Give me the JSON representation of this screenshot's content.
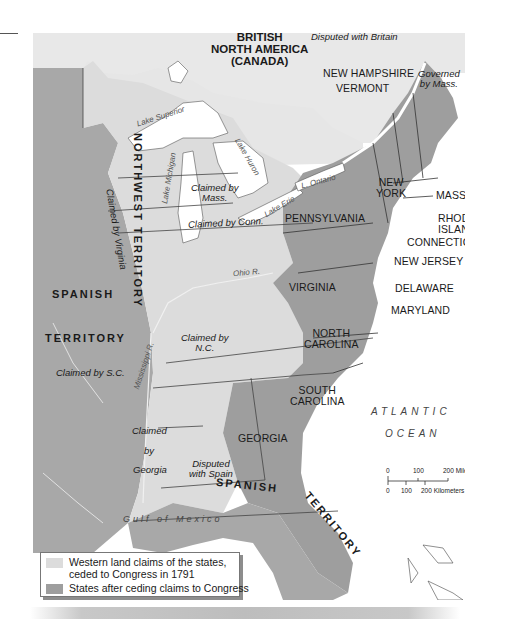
{
  "map": {
    "title_rule": true,
    "colors": {
      "states_fill": "#9e9e9e",
      "western_claims_fill": "#dcdcdc",
      "spanish_territory_fill": "#a8a8a8",
      "canada_fill": "#e6e6e6",
      "water": "#ffffff",
      "border": "#3a3a3a",
      "river": "#f2f2f2"
    },
    "regions": {
      "british_north_america": [
        "BRITISH",
        "NORTH AMERICA",
        "(CANADA)"
      ],
      "disputed_with_britain": "Disputed with Britain",
      "st_lawrence": "St. Lawrence R.",
      "new_hampshire": "NEW HAMPSHIRE",
      "vermont": "VERMONT",
      "governed_by_mass": [
        "Governed",
        "by Mass."
      ],
      "new_york": [
        "NEW",
        "YORK"
      ],
      "mass": "MASS.",
      "rhode_island": [
        "RHODE",
        "ISLAND"
      ],
      "connecticut": "CONNECTICUT",
      "pennsylvania": "PENNSYLVANIA",
      "new_jersey": "NEW JERSEY",
      "delaware": "DELAWARE",
      "maryland": "MARYLAND",
      "virginia": "VIRGINIA",
      "north_carolina": [
        "NORTH",
        "CAROLINA"
      ],
      "south_carolina": [
        "SOUTH",
        "CAROLINA"
      ],
      "georgia": "GEORGIA",
      "northwest_territory": "NORTHWEST TERRITORY",
      "claimed_by_mass": [
        "Claimed by",
        "Mass."
      ],
      "claimed_by_conn": "Claimed by Conn.",
      "claimed_by_virginia": [
        "Claimed",
        "by",
        "Virginia"
      ],
      "claimed_by_nc": [
        "Claimed by",
        "N.C."
      ],
      "claimed_by_sc": "Claimed by S.C.",
      "claimed_by_georgia": [
        "Claimed",
        "by",
        "Georgia"
      ],
      "disputed_with_spain": [
        "Disputed",
        "with Spain"
      ],
      "spanish_territory_west": [
        "SPANISH",
        "TERRITORY"
      ],
      "spanish_territory_south": [
        "SPANISH",
        "TERRITORY"
      ]
    },
    "water_labels": {
      "lake_superior": "Lake Superior",
      "lake_michigan": "Lake Michigan",
      "lake_huron": "Lake Huron",
      "lake_erie": "Lake Erie",
      "lake_ontario": "L. Ontario",
      "ohio_river": "Ohio R.",
      "mississippi_river": "Mississippi R.",
      "gulf_of_mexico": "Gulf of Mexico",
      "atlantic": "ATLANTIC",
      "ocean": "OCEAN"
    },
    "scale": {
      "miles": [
        "0",
        "100",
        "200 Miles"
      ],
      "kilometers": [
        "0",
        "100",
        "200 Kilometers"
      ]
    },
    "legend": {
      "items": [
        {
          "label_line1": "Western land claims of the states,",
          "label_line2": "ceded to Congress in 1791",
          "swatch": "#dcdcdc"
        },
        {
          "label_line1": "States after ceding claims to Congress",
          "swatch": "#9e9e9e"
        }
      ]
    }
  }
}
